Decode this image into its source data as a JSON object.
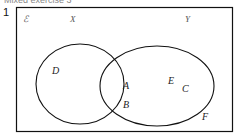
{
  "heading": "Mixed exercise 3",
  "question_number": "1",
  "diagram": {
    "type": "venn",
    "universal_label": "ℰ",
    "sets": [
      {
        "name": "X",
        "label": "X"
      },
      {
        "name": "Y",
        "label": "Y"
      }
    ],
    "regions": {
      "X_only": [
        "D"
      ],
      "X_and_Y": [
        "A",
        "B"
      ],
      "Y_only": [
        "E",
        "C"
      ],
      "outside": [
        "F"
      ]
    },
    "labels": {
      "universal": "ℰ",
      "set_x": "X",
      "set_y": "Y",
      "d": "D",
      "a": "A",
      "b": "B",
      "e": "E",
      "c": "C",
      "f": "F"
    },
    "colors": {
      "stroke": "#111111",
      "background": "#ffffff"
    }
  }
}
